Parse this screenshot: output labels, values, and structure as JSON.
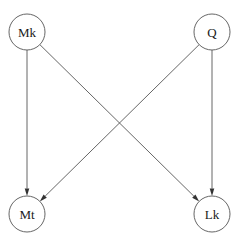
{
  "diagram": {
    "background_color": "#ffffff",
    "node_stroke_color": "#555555",
    "edge_color": "#555555",
    "arrow_color": "#333333",
    "label_color": "#1a1a1a",
    "nodes": [
      {
        "id": "Mk",
        "label": "Mk",
        "cx": 27,
        "cy": 32,
        "r": 18
      },
      {
        "id": "Q",
        "label": "Q",
        "cx": 212,
        "cy": 32,
        "r": 18
      },
      {
        "id": "Mt",
        "label": "Mt",
        "cx": 27,
        "cy": 214,
        "r": 18
      },
      {
        "id": "Lk",
        "label": "Lk",
        "cx": 212,
        "cy": 214,
        "r": 18
      }
    ],
    "edges": [
      {
        "id": "Mk-Mt",
        "from": "Mk",
        "to": "Mt",
        "directed": true
      },
      {
        "id": "Mk-Lk",
        "from": "Mk",
        "to": "Lk",
        "directed": true
      },
      {
        "id": "Q-Lk",
        "from": "Q",
        "to": "Lk",
        "directed": true
      },
      {
        "id": "Q-Mt",
        "from": "Q",
        "to": "Mt",
        "directed": true
      }
    ]
  }
}
